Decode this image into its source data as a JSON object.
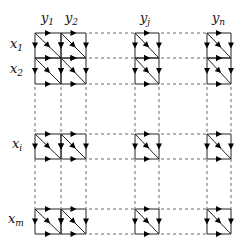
{
  "diagram": {
    "type": "grid-dag",
    "column_labels": [
      {
        "base": "y",
        "sub": "1"
      },
      {
        "base": "y",
        "sub": "2"
      },
      {
        "base": "y",
        "sub": "j"
      },
      {
        "base": "y",
        "sub": "n"
      }
    ],
    "row_labels": [
      {
        "base": "x",
        "sub": "1"
      },
      {
        "base": "x",
        "sub": "2"
      },
      {
        "base": "x",
        "sub": "i"
      },
      {
        "base": "x",
        "sub": "m"
      }
    ],
    "column_groups": [
      {
        "xs": [
          35,
          61,
          86
        ],
        "label_indices": [
          0,
          1
        ]
      },
      {
        "xs": [
          135,
          159
        ],
        "label_indices": [
          2
        ]
      },
      {
        "xs": [
          207,
          231
        ],
        "label_indices": [
          3
        ]
      }
    ],
    "row_groups": [
      {
        "ys": [
          33,
          58,
          84
        ],
        "label_indices": [
          0,
          1
        ]
      },
      {
        "ys": [
          134,
          159
        ],
        "label_indices": [
          2
        ]
      },
      {
        "ys": [
          209,
          234
        ],
        "label_indices": [
          3
        ]
      }
    ],
    "colors": {
      "line": "#222222",
      "dashed": "#555555",
      "arrow": "#000000"
    }
  }
}
